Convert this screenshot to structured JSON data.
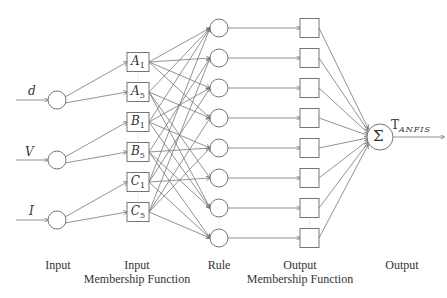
{
  "diagram": {
    "inputs": [
      {
        "label": "d",
        "y": 100
      },
      {
        "label": "V",
        "y": 160
      },
      {
        "label": "I",
        "y": 220
      }
    ],
    "membership_functions": [
      {
        "var": "A",
        "sub": "1",
        "y": 62
      },
      {
        "var": "A",
        "sub": "5",
        "y": 92
      },
      {
        "var": "B",
        "sub": "1",
        "y": 122
      },
      {
        "var": "B",
        "sub": "5",
        "y": 152
      },
      {
        "var": "C",
        "sub": "1",
        "y": 182
      },
      {
        "var": "C",
        "sub": "5",
        "y": 212
      }
    ],
    "rule_count": 8,
    "output_mf_count": 8,
    "sum_symbol": "Σ",
    "output_label": "T",
    "output_subscript": "ANFIS",
    "layer_labels": [
      {
        "line1": "Input",
        "line2": ""
      },
      {
        "line1": "Input",
        "line2": "Membership Function"
      },
      {
        "line1": "Rule",
        "line2": ""
      },
      {
        "line1": "Output",
        "line2": "Membership Function"
      },
      {
        "line1": "Output",
        "line2": ""
      }
    ],
    "colors": {
      "stroke": "#666666",
      "text": "#333333",
      "dots": "#bbbbbb"
    }
  }
}
